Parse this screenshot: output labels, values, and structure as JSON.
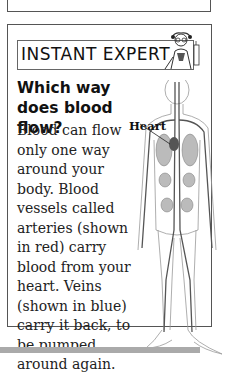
{
  "banner": {
    "title": "INSTANT EXPERT"
  },
  "article": {
    "heading": "Which way does blood flow?",
    "body": "Blood can flow only one way around your body. Blood vessels called arteries (shown in red) carry blood from your heart. Veins (shown in blue) carry it back, to be pumped around again."
  },
  "figure": {
    "label": "Heart",
    "icon": "circulatory-system-illustration"
  },
  "colors": {
    "border": "#555555",
    "text": "#222222",
    "ground_bar": "#aaaaaa"
  }
}
